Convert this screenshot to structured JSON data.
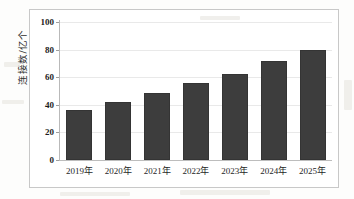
{
  "chart_data": {
    "type": "bar",
    "title": "",
    "xlabel": "",
    "ylabel": "连接数/亿个",
    "categories": [
      "2019年",
      "2020年",
      "2021年",
      "2022年",
      "2023年",
      "2024年",
      "2025年"
    ],
    "values": [
      36,
      42,
      48.5,
      55.5,
      62,
      71.5,
      80
    ],
    "ylim": [
      0,
      100
    ],
    "yticks": [
      0,
      20,
      40,
      60,
      80,
      100
    ],
    "ytick_labels": [
      "0",
      "20",
      "40",
      "60",
      "80",
      "100"
    ],
    "grid": true,
    "legend": "none",
    "series": [
      {
        "name": "连接数/亿个",
        "values": [
          36,
          42,
          48.5,
          55.5,
          62,
          71.5,
          80
        ]
      }
    ],
    "colors": {
      "bar": "#3d3d3d",
      "gridline": "#e9e9e9",
      "axis": "#bdbdbd",
      "frame": "#c8c8c8",
      "text": "#1c1c1c",
      "background": "#ffffff"
    }
  }
}
